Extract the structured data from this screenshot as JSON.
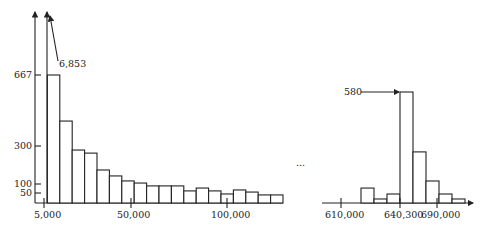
{
  "chart_data": [
    {
      "type": "bar",
      "title": "",
      "xlabel": "",
      "ylabel": "",
      "bin_width": 5000,
      "x_tick_labels": [
        "5,000",
        "50,000",
        "100,000"
      ],
      "y_tick_labels": [
        "50",
        "100",
        "300",
        "667"
      ],
      "annotations": [
        "6,853"
      ],
      "values": [
        6853,
        667,
        427,
        276,
        260,
        172,
        141,
        115,
        104,
        89,
        89,
        89,
        63,
        78,
        63,
        47,
        68,
        57,
        42,
        42
      ],
      "ylim": [
        0,
        667
      ]
    },
    {
      "type": "bar",
      "title": "",
      "xlabel": "",
      "ylabel": "",
      "x_tick_labels": [
        "610,000",
        "640,300",
        "690,000"
      ],
      "annotations": [
        "580"
      ],
      "values": [
        0,
        0,
        0,
        78,
        21,
        47,
        580,
        267,
        115,
        47,
        21
      ],
      "ylim": [
        0,
        580
      ]
    }
  ],
  "labels": {
    "left_top": "6,853",
    "y667": "667",
    "y300": "300",
    "y100": "100",
    "y50": "50",
    "x5000": "5,000",
    "x50000": "50,000",
    "x100000": "100,000",
    "right_top": "580",
    "x610000": "610,000",
    "x640300": "640,300",
    "x690000": "690,000",
    "ellipsis": "..."
  }
}
